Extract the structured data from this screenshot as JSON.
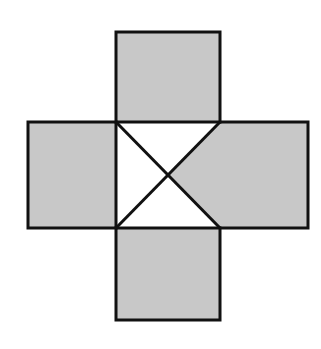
{
  "figure": {
    "colors": {
      "fill": "#c8c8c8",
      "stroke": "#111111",
      "background": "#ffffff",
      "center_fill": "#ffffff"
    },
    "stroke_width": 3,
    "center_square": {
      "x": 116,
      "y": 122,
      "w": 104,
      "h": 106
    },
    "top_square": {
      "x": 116,
      "y": 32,
      "w": 104,
      "h": 90
    },
    "left_rect": {
      "x": 28,
      "y": 122,
      "w": 88,
      "h": 106
    },
    "right_rect": {
      "x": 220,
      "y": 122,
      "w": 88,
      "h": 106
    },
    "bottom_square": {
      "x": 116,
      "y": 228,
      "w": 104,
      "h": 92
    },
    "diagonal_intersection": {
      "x": 168,
      "y": 175
    },
    "shaded_triangle": "right"
  }
}
